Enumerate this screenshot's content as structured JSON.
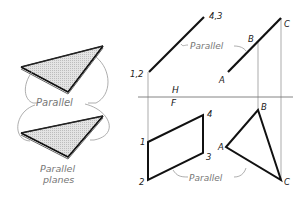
{
  "diagram": {
    "left_panel": {
      "parallel_label": "Parallel",
      "caption_line1": "Parallel",
      "caption_line2": "planes"
    },
    "top_view": {
      "edge_label_start": "1,2",
      "edge_label_end": "4,3",
      "parallel_label": "Parallel",
      "point_a": "A",
      "point_b": "B",
      "point_c": "C"
    },
    "reference_line": {
      "upper_label": "H",
      "lower_label": "F"
    },
    "front_view": {
      "point_1": "1",
      "point_2": "2",
      "point_3": "3",
      "point_4": "4",
      "point_a": "A",
      "point_b": "B",
      "point_c": "C",
      "parallel_label": "Parallel"
    },
    "colors": {
      "line": "#111111",
      "projection": "#888888",
      "plane_fill": "#d8d8d8",
      "annotation": "#888888"
    }
  }
}
